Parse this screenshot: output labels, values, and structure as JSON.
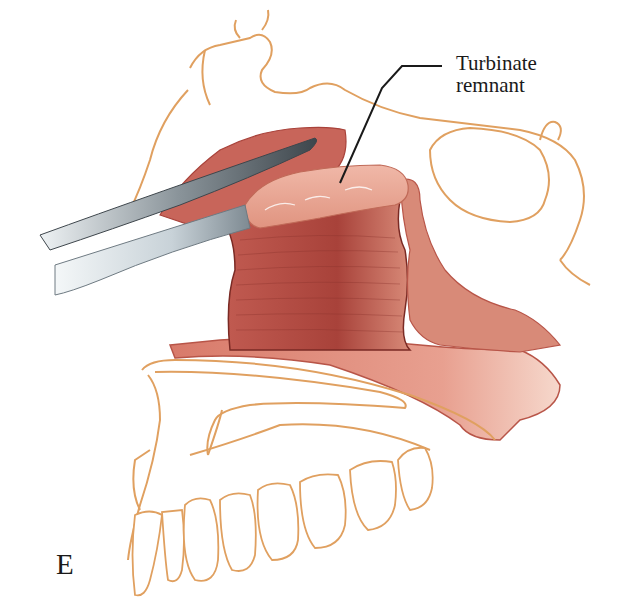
{
  "figure": {
    "panel_letter": "E",
    "callouts": [
      {
        "line1": "Turbinate",
        "line2": "remnant"
      }
    ],
    "colors": {
      "bone_outline": "#e0a060",
      "mucosa_dark": "#a8423a",
      "mucosa_mid": "#c8655a",
      "mucosa_light": "#e8a090",
      "instrument_dark": "#4a5258",
      "instrument_light": "#dfe6ea",
      "leader_line": "#1a1a1a"
    }
  }
}
